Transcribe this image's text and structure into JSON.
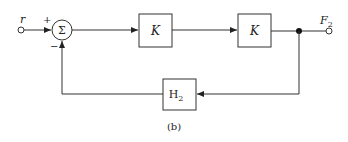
{
  "diagram": {
    "input_label": "r",
    "plus_sign": "+",
    "minus_sign": "−",
    "sum_symbol": "Σ",
    "block1_label": "K",
    "block2_label": "K",
    "feedback_block": {
      "main": "H",
      "sub": "2"
    },
    "output_label": {
      "main": "F",
      "sub": "2"
    },
    "caption": "(b)",
    "colors": {
      "stroke": "#333333",
      "background": "#ffffff"
    }
  }
}
